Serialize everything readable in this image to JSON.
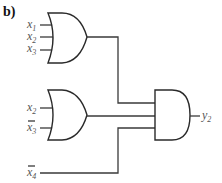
{
  "diagram": {
    "label": "b)",
    "inputs": [
      {
        "name": "x",
        "sub": "1",
        "negated": false,
        "gate": "or1"
      },
      {
        "name": "x",
        "sub": "2",
        "negated": false,
        "gate": "or1"
      },
      {
        "name": "x",
        "sub": "3",
        "negated": false,
        "gate": "or1"
      },
      {
        "name": "x",
        "sub": "2",
        "negated": false,
        "gate": "or2"
      },
      {
        "name": "x",
        "sub": "3",
        "negated": true,
        "gate": "or2"
      },
      {
        "name": "x",
        "sub": "4",
        "negated": true,
        "gate": "and1"
      }
    ],
    "gates": [
      {
        "id": "or1",
        "type": "OR",
        "inputs": 3
      },
      {
        "id": "or2",
        "type": "OR",
        "inputs": 2
      },
      {
        "id": "and1",
        "type": "AND",
        "inputs": 3
      }
    ],
    "output": {
      "name": "y",
      "sub": "2"
    },
    "colors": {
      "line": "#2a2a2a",
      "text": "#555555"
    }
  }
}
